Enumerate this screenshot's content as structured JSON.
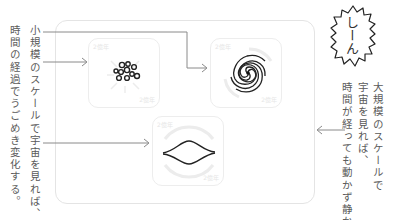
{
  "left_caption": {
    "line1": "小規模のスケールで宇宙を見れば、",
    "line2": "時間の経過でうごめき変化する。"
  },
  "right_caption": {
    "line1": "大規模のスケールで",
    "line2": "宇宙を見れば、",
    "line3": "時間が経っても動かず静か。"
  },
  "bubble": {
    "text": "しーん"
  },
  "panels": [
    {
      "id": "dots",
      "icon": "particle-cluster-icon",
      "corner_top": "2億年",
      "corner_bottom": "2億年"
    },
    {
      "id": "spiral",
      "icon": "spiral-galaxy-icon",
      "corner_top": "2億年",
      "corner_bottom": "2億年"
    },
    {
      "id": "lens",
      "icon": "lens-wave-icon",
      "corner_top": "2億年",
      "corner_bottom": "2億年"
    }
  ],
  "colors": {
    "text": "#5a5a5a",
    "line": "#888888",
    "border": "#e4e4e4",
    "ink": "#222222"
  }
}
